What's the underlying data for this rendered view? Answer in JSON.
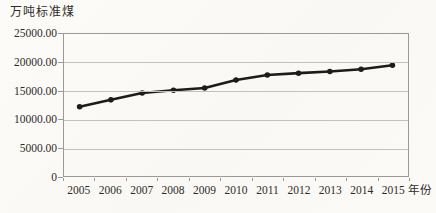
{
  "figure": {
    "y_axis_title": "万吨标准煤",
    "x_axis_unit": "年份"
  },
  "colors": {
    "line": "#1c1c1c",
    "marker": "#1c1c1c",
    "grid": "#c2c1be",
    "axis": "#9b9a98",
    "text": "#2e2c29",
    "background": "#fbfaf7"
  },
  "chart_data": {
    "type": "line",
    "title": "",
    "ylabel": "万吨标准煤",
    "xlabel_suffix": "年份",
    "categories": [
      "2005",
      "2006",
      "2007",
      "2008",
      "2009",
      "2010",
      "2011",
      "2012",
      "2013",
      "2014",
      "2015"
    ],
    "values": [
      12200,
      13400,
      14600,
      15100,
      15500,
      16900,
      17800,
      18100,
      18400,
      18800,
      19500
    ],
    "ylim": [
      0,
      25000
    ],
    "ytick_values": [
      0,
      5000,
      10000,
      15000,
      20000,
      25000
    ],
    "ytick_labels": [
      "0",
      "5000.00",
      "10000.00",
      "15000.00",
      "20000.00",
      "25000.00"
    ],
    "grid": true,
    "legend": false,
    "marker": "circle",
    "line_width": 2.6,
    "marker_radius": 2.8
  }
}
